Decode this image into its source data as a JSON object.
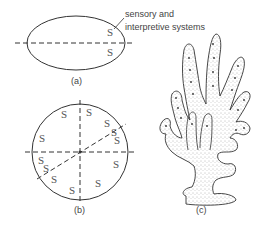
{
  "panels": {
    "a": {
      "caption": "(a)",
      "symbol": "S",
      "annotation_line1": "sensory and",
      "annotation_line2": "interpretive systems"
    },
    "b": {
      "caption": "(b)",
      "symbol": "S"
    },
    "c": {
      "caption": "(c)"
    }
  },
  "colors": {
    "stroke": "#333333",
    "stipple": "#777777"
  }
}
